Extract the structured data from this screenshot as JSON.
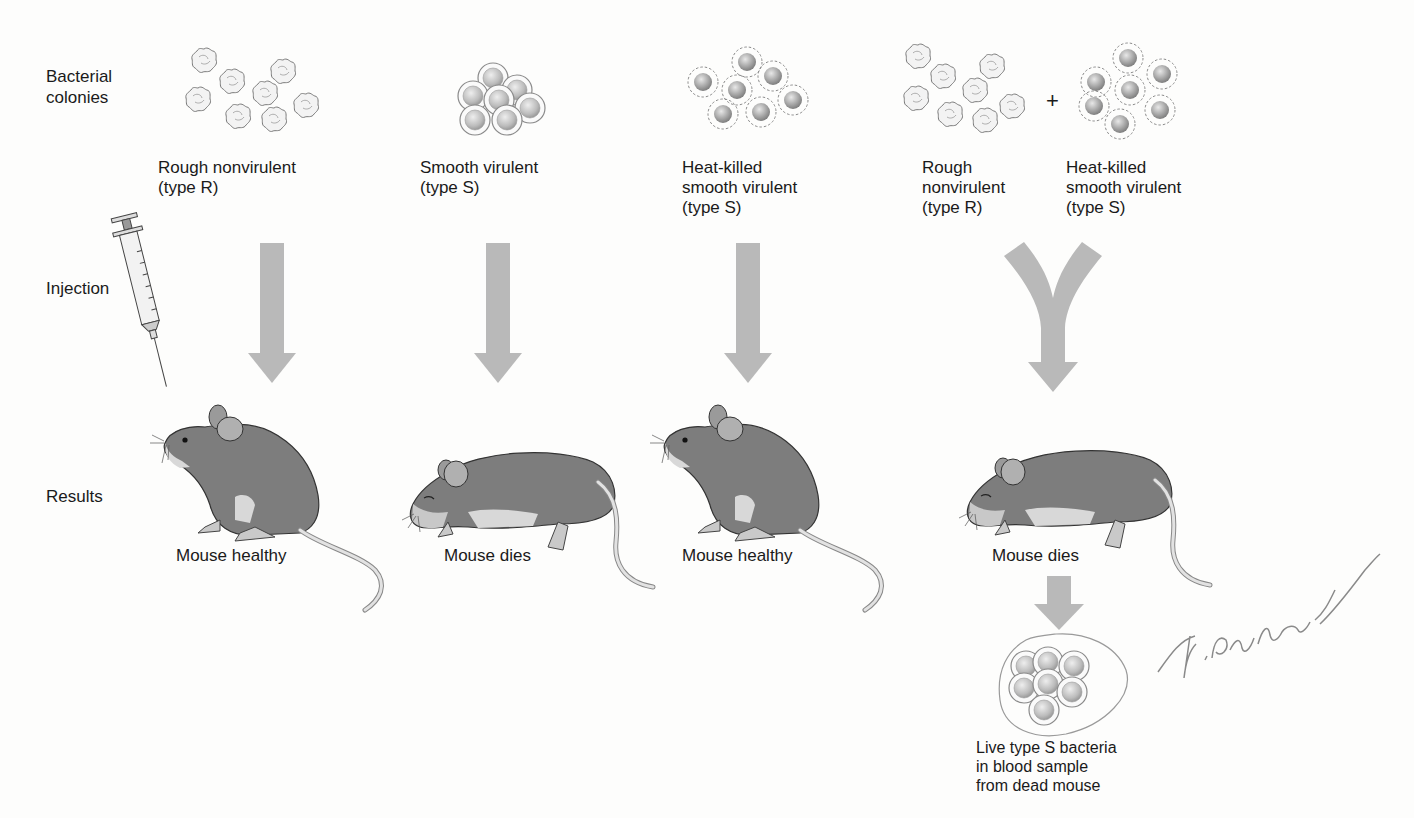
{
  "row_labels": {
    "colonies": "Bacterial\ncolonies",
    "injection": "Injection",
    "results": "Results"
  },
  "columns": [
    {
      "strain_label": "Rough nonvirulent\n(type R)",
      "colony_type": "rough",
      "result": "Mouse healthy",
      "mouse_state": "alive"
    },
    {
      "strain_label": "Smooth virulent\n(type S)",
      "colony_type": "smooth-live",
      "result": "Mouse dies",
      "mouse_state": "dead"
    },
    {
      "strain_label": "Heat-killed\nsmooth virulent\n(type S)",
      "colony_type": "smooth-heat-killed",
      "result": "Mouse healthy",
      "mouse_state": "alive"
    },
    {
      "strain_label_a": "Rough\nnonvirulent\n(type R)",
      "plus": "+",
      "strain_label_b": "Heat-killed\nsmooth virulent\n(type S)",
      "colony_type": "mixture",
      "result": "Mouse dies",
      "mouse_state": "dead"
    }
  ],
  "blood_sample": {
    "label": "Live type S bacteria\nin blood sample\nfrom dead mouse"
  },
  "handwriting": "Virulent",
  "colors": {
    "arrow": "#b9b9b9",
    "mouse_body": "#7d7d7d",
    "mouse_light": "#d6d6d6",
    "bacterium": "#a8a8a8"
  }
}
